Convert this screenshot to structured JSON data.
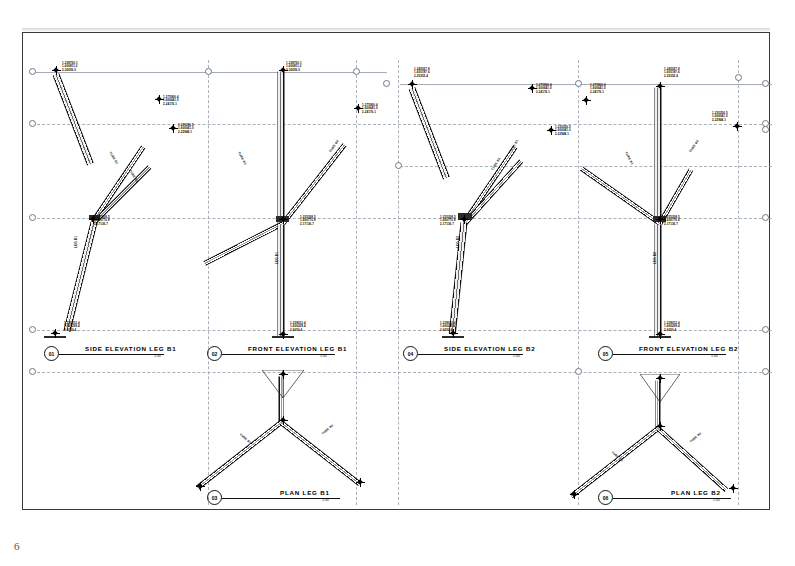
{
  "sheet": {
    "page_number": "6",
    "background": "#ffffff",
    "frame_color": "#3a3a3a",
    "gridline_color": "#9aa3ad",
    "line_color": "#111111"
  },
  "views": [
    {
      "id": "01",
      "number": "01",
      "title": "SIDE ELEVATION LEG B1",
      "scale": "1:50",
      "title_x": 44,
      "title_y": 346,
      "rule_w": 105,
      "name_x": 26,
      "scale_x": 95
    },
    {
      "id": "02",
      "number": "02",
      "title": "FRONT ELEVATION LEG B1",
      "scale": "1:50",
      "title_x": 207,
      "title_y": 346,
      "rule_w": 113,
      "name_x": 26,
      "scale_x": 98
    },
    {
      "id": "03",
      "number": "03",
      "title": "PLAN LEG B1",
      "scale": "1:50",
      "title_x": 207,
      "title_y": 490,
      "rule_w": 118,
      "name_x": 58,
      "scale_x": 100
    },
    {
      "id": "04",
      "number": "04",
      "title": "SIDE ELEVATION LEG B2",
      "scale": "1:50",
      "title_x": 403,
      "title_y": 346,
      "rule_w": 105,
      "name_x": 26,
      "scale_x": 95
    },
    {
      "id": "05",
      "number": "05",
      "title": "FRONT ELEVATION LEG B2",
      "scale": "1:50",
      "title_x": 598,
      "title_y": 346,
      "rule_w": 113,
      "name_x": 26,
      "scale_x": 98
    },
    {
      "id": "06",
      "number": "06",
      "title": "PLAN LEG B2",
      "scale": "1:50",
      "title_x": 598,
      "title_y": 490,
      "rule_w": 118,
      "name_x": 58,
      "scale_x": 100
    }
  ],
  "node_labels": [
    {
      "x": 62,
      "y": 62,
      "l1": "1-238750.1",
      "l2": "1-606811.2",
      "l3": "2-26056.5"
    },
    {
      "x": 163,
      "y": 96,
      "l1": "1-275900.4",
      "l2": "1-606641.0",
      "l3": "2-24176.1"
    },
    {
      "x": 178,
      "y": 124,
      "l1": "1-235256.5",
      "l2": "1-606041.0",
      "l3": "2-22948.1"
    },
    {
      "x": 94,
      "y": 216,
      "l1": "1-235208.5",
      "l2": "1-606770.8",
      "l3": "2-17136.7"
    },
    {
      "x": 64,
      "y": 322,
      "l1": "1-239012.4",
      "l2": "1-606209.4",
      "l3": "2-6050.4"
    },
    {
      "x": 286,
      "y": 62,
      "l1": "1-238750.1",
      "l2": "1-606811.2",
      "l3": "2-26056.5"
    },
    {
      "x": 362,
      "y": 104,
      "l1": "1-275900.4",
      "l2": "1-606641.0",
      "l3": "2-24176.1"
    },
    {
      "x": 300,
      "y": 216,
      "l1": "1-235208.5",
      "l2": "1-606770.8",
      "l3": "2-17136.7"
    },
    {
      "x": 290,
      "y": 322,
      "l1": "1-239012.4",
      "l2": "1-606209.4",
      "l3": "2-6050.4"
    },
    {
      "x": 414,
      "y": 68,
      "l1": "1-245027.8",
      "l2": "1-605197.6",
      "l3": "2-25252.4"
    },
    {
      "x": 536,
      "y": 84,
      "l1": "1-275900.4",
      "l2": "1-606641.0",
      "l3": "2-24176.1"
    },
    {
      "x": 555,
      "y": 126,
      "l1": "1-235256.5",
      "l2": "1-606041.0",
      "l3": "2-22948.1"
    },
    {
      "x": 440,
      "y": 216,
      "l1": "1-235208.5",
      "l2": "1-606770.8",
      "l3": "2-17136.7"
    },
    {
      "x": 440,
      "y": 322,
      "l1": "1-239012.4",
      "l2": "1-606209.4",
      "l3": "2-6050.4"
    },
    {
      "x": 590,
      "y": 84,
      "l1": "1-275900.4",
      "l2": "1-606641.0",
      "l3": "2-24176.1"
    },
    {
      "x": 664,
      "y": 68,
      "l1": "1-245027.8",
      "l2": "1-605197.6",
      "l3": "2-25252.4"
    },
    {
      "x": 664,
      "y": 216,
      "l1": "1-235208.5",
      "l2": "1-606770.8",
      "l3": "2-17136.7"
    },
    {
      "x": 712,
      "y": 112,
      "l1": "1-235256.5",
      "l2": "1-606041.0",
      "l3": "2-22948.1"
    },
    {
      "x": 664,
      "y": 322,
      "l1": "1-239012.4",
      "l2": "1-606209.4",
      "l3": "2-6050.4"
    }
  ],
  "member_labels": [
    {
      "x": 110,
      "y": 150,
      "rot": 58,
      "text": "TUBE B1"
    },
    {
      "x": 130,
      "y": 168,
      "rot": 58,
      "text": "TUBE B2"
    },
    {
      "x": 76,
      "y": 246,
      "rot": -90,
      "text": "LEG B1"
    },
    {
      "x": 239,
      "y": 150,
      "rot": 62,
      "text": "TUBE B1"
    },
    {
      "x": 330,
      "y": 150,
      "rot": -56,
      "text": "TUBE B2"
    },
    {
      "x": 277,
      "y": 262,
      "rot": -90,
      "text": "LEG B1"
    },
    {
      "x": 510,
      "y": 150,
      "rot": -58,
      "text": "TUBE B1"
    },
    {
      "x": 492,
      "y": 168,
      "rot": -58,
      "text": "TUBE B2"
    },
    {
      "x": 458,
      "y": 246,
      "rot": -90,
      "text": "LEG B2"
    },
    {
      "x": 626,
      "y": 150,
      "rot": 62,
      "text": "TUBE B1"
    },
    {
      "x": 690,
      "y": 150,
      "rot": -56,
      "text": "TUBE B2"
    },
    {
      "x": 655,
      "y": 262,
      "rot": -90,
      "text": "LEG B2"
    },
    {
      "x": 240,
      "y": 432,
      "rot": 40,
      "text": "TUBE B1"
    },
    {
      "x": 322,
      "y": 432,
      "rot": -40,
      "text": "TUBE B2"
    },
    {
      "x": 612,
      "y": 450,
      "rot": 40,
      "text": "TUBE B1"
    },
    {
      "x": 690,
      "y": 440,
      "rot": -40,
      "text": "TUBE B2"
    }
  ]
}
